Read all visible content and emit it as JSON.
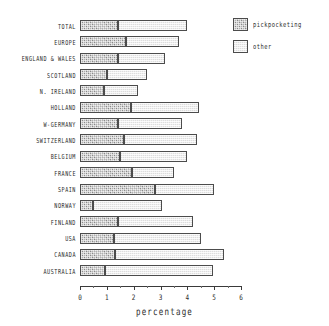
{
  "chart_data": {
    "type": "bar",
    "orientation": "horizontal",
    "stacked": true,
    "title": "",
    "xlabel": "percentage",
    "ylabel": "",
    "xlim": [
      0,
      6
    ],
    "xticks": [
      0,
      1,
      2,
      3,
      4,
      5,
      6
    ],
    "xtick_labels": [
      "0",
      "1",
      "2",
      "3",
      "4",
      "5",
      "6"
    ],
    "grid": false,
    "legend_position": "top-right",
    "categories": [
      "TOTAL",
      "EUROPE",
      "ENGLAND & WALES",
      "SCOTLAND",
      "N. IRELAND",
      "HOLLAND",
      "W-GERMANY",
      "SWITZERLAND",
      "BELGIUM",
      "FRANCE",
      "SPAIN",
      "NORWAY",
      "FINLAND",
      "USA",
      "CANADA",
      "AUSTRALIA"
    ],
    "series": [
      {
        "name": "pickpocketing",
        "color": "#b0b0b0",
        "values": [
          1.4,
          1.7,
          1.4,
          1.0,
          0.9,
          1.9,
          1.4,
          1.65,
          1.5,
          1.95,
          2.8,
          0.5,
          1.4,
          1.25,
          1.3,
          0.95
        ]
      },
      {
        "name": "other",
        "color": "#eeeeee",
        "values": [
          2.6,
          2.0,
          1.75,
          1.5,
          1.25,
          2.55,
          2.4,
          2.7,
          2.5,
          1.55,
          2.2,
          2.55,
          2.8,
          3.25,
          4.05,
          4.0
        ]
      }
    ],
    "totals": [
      4.0,
      3.7,
      3.15,
      2.5,
      2.15,
      4.45,
      3.8,
      4.35,
      4.0,
      3.5,
      5.0,
      3.05,
      4.2,
      4.5,
      5.35,
      4.95
    ]
  },
  "legend": {
    "items": [
      {
        "label": "pickpocketing",
        "swatch": "dark-hatched"
      },
      {
        "label": "other",
        "swatch": "light-hatched"
      }
    ]
  },
  "axis": {
    "x_title": "percentage"
  }
}
